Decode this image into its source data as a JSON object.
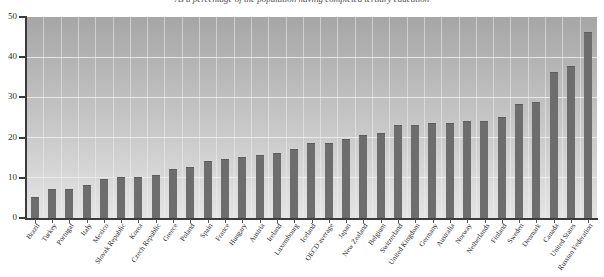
{
  "chart_data": {
    "type": "bar",
    "title": "As a percentage of the population having completed tertiary education",
    "xlabel": "",
    "ylabel": "",
    "ylim": [
      0,
      50
    ],
    "yticks": [
      0,
      10,
      20,
      30,
      40,
      50
    ],
    "grid": true,
    "legend": null,
    "categories": [
      "Brazil",
      "Turkey",
      "Portugal",
      "Italy",
      "Mexico",
      "Slovak Republic",
      "Korea",
      "Czech Republic",
      "Greece",
      "Poland",
      "Spain",
      "France",
      "Hungary",
      "Austria",
      "Ireland",
      "Luxembourg",
      "Iceland",
      "OECD average",
      "Japan",
      "New Zealand",
      "Belgium",
      "Switzerland",
      "United Kingdom",
      "Germany",
      "Australia",
      "Norway",
      "Netherlands",
      "Finland",
      "Sweden",
      "Denmark",
      "Canada",
      "United States",
      "Russian Federation"
    ],
    "values": [
      5,
      7,
      7,
      8,
      9.5,
      10,
      10,
      10.5,
      12,
      12.5,
      14,
      14.5,
      15,
      15.5,
      16,
      17,
      18.5,
      18.5,
      19.5,
      20.5,
      21,
      23,
      23,
      23.5,
      23.5,
      24,
      24,
      25,
      28,
      28.5,
      36,
      37.5,
      46
    ]
  },
  "axis": {
    "y_tick_labels": [
      "50",
      "40",
      "30",
      "20",
      "10",
      "0"
    ]
  }
}
